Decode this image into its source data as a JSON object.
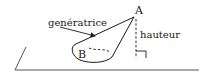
{
  "diagram": {
    "type": "oblique-cone",
    "labels": {
      "apex": "A",
      "base_point": "B",
      "generatrix": "genératrice",
      "height": "hauteur"
    },
    "colors": {
      "stroke": "#1a1a1a",
      "plane": "#555555",
      "background": "#ffffff"
    }
  }
}
